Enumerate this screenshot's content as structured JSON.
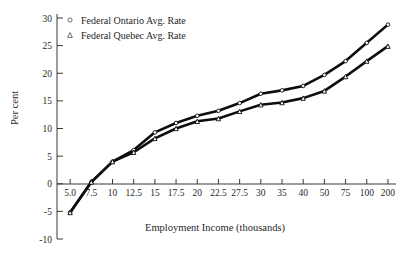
{
  "chart_data": {
    "type": "line",
    "title": "",
    "xlabel": "Employment Income (thousands)",
    "ylabel": "Per cent",
    "ylim": [
      -10,
      30
    ],
    "yticks": [
      "30",
      "25",
      "20",
      "15",
      "10",
      "5",
      "0",
      "-5",
      "-10"
    ],
    "ytick_values": [
      30,
      25,
      20,
      15,
      10,
      5,
      0,
      -5,
      -10
    ],
    "grid": false,
    "legend_position": "upper-left-inside",
    "categories": [
      "5.0",
      "7.5",
      "10",
      "12.5",
      "15",
      "17.5",
      "20",
      "22.5",
      "27.5",
      "30",
      "35",
      "40",
      "50",
      "75",
      "100",
      "200"
    ],
    "series": [
      {
        "name": "Federal Ontario Avg. Rate",
        "marker": "circle",
        "values": [
          -5.2,
          0.3,
          4.0,
          6.1,
          9.3,
          11.0,
          12.3,
          13.2,
          14.6,
          16.3,
          16.9,
          17.7,
          19.7,
          22.2,
          25.5,
          28.8
        ]
      },
      {
        "name": "Federal Quebec Avg. Rate",
        "marker": "triangle",
        "values": [
          -5.2,
          0.3,
          4.0,
          5.7,
          8.2,
          10.0,
          11.3,
          11.8,
          13.1,
          14.3,
          14.7,
          15.5,
          16.8,
          19.4,
          22.2,
          24.9
        ]
      }
    ]
  },
  "legend": {
    "items": [
      {
        "label": "Federal Ontario Avg. Rate",
        "marker": "circle-marker-icon"
      },
      {
        "label": "Federal Quebec Avg. Rate",
        "marker": "triangle-marker-icon"
      }
    ]
  },
  "colors": {
    "line": "#0d0d0d",
    "axis": "#3a3a3a",
    "text": "#1f1f1f",
    "background": "#ffffff",
    "marker_fill": "#ffffff"
  }
}
